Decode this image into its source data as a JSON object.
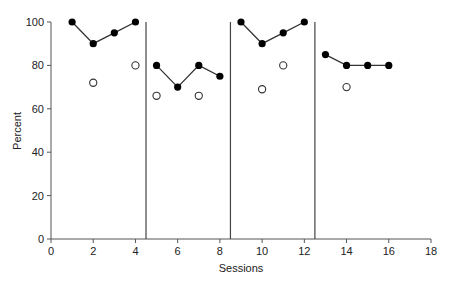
{
  "chart_data": {
    "type": "scatter",
    "title": "",
    "xlabel": "Sessions",
    "ylabel": "Percent",
    "xlim": [
      0,
      18
    ],
    "ylim": [
      0,
      100
    ],
    "xticks": [
      0,
      2,
      4,
      6,
      8,
      10,
      12,
      14,
      16,
      18
    ],
    "yticks": [
      0,
      20,
      40,
      60,
      80,
      100
    ],
    "grid": false,
    "legend": null,
    "phase_change_lines_x": [
      4.5,
      8.5,
      12.5
    ],
    "series": [
      {
        "name": "filled",
        "marker": "filled-circle",
        "connected_within_phase": true,
        "phases": [
          {
            "x": [
              1,
              2,
              3,
              4
            ],
            "y": [
              100,
              90,
              95,
              100
            ]
          },
          {
            "x": [
              5,
              6,
              7,
              8
            ],
            "y": [
              80,
              70,
              80,
              75
            ]
          },
          {
            "x": [
              9,
              10,
              11,
              12
            ],
            "y": [
              100,
              90,
              95,
              100
            ]
          },
          {
            "x": [
              13,
              14,
              15,
              16
            ],
            "y": [
              85,
              80,
              80,
              80
            ]
          }
        ]
      },
      {
        "name": "open",
        "marker": "open-circle",
        "connected_within_phase": false,
        "x": [
          2,
          4,
          5,
          7,
          10,
          11,
          14
        ],
        "y": [
          72,
          80,
          66,
          66,
          69,
          80,
          70
        ]
      }
    ]
  }
}
